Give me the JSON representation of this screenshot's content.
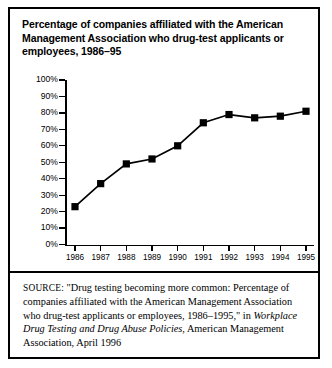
{
  "figure": {
    "title": "Percentage of companies affiliated with the American Management Association who drug-test applicants or employees, 1986–95",
    "source": {
      "label": "SOURCE:",
      "text_part1": " \"Drug testing becoming more common: Percentage of companies affiliated with the American Management Association who drug-test applicants or employees, 1986–1995,\" in ",
      "italic_title": "Workplace Drug Testing and Drug Abuse Policies",
      "text_part2": ", American Management Association, April 1996"
    }
  },
  "chart_data": {
    "type": "line",
    "title": "Percentage of companies affiliated with the American Management Association who drug-test applicants or employees, 1986–95",
    "xlabel": "",
    "ylabel": "",
    "categories": [
      "1986",
      "1987",
      "1988",
      "1989",
      "1990",
      "1991",
      "1992",
      "1993",
      "1994",
      "1995"
    ],
    "values": [
      23,
      37,
      49,
      52,
      60,
      74,
      79,
      77,
      78,
      81
    ],
    "ylim": [
      0,
      100
    ],
    "ytick_labels": [
      "100%",
      "90%",
      "80%",
      "70%",
      "60%",
      "50%",
      "40%",
      "30%",
      "20%",
      "10%",
      "0%"
    ],
    "ytick_values": [
      100,
      90,
      80,
      70,
      60,
      50,
      40,
      30,
      20,
      10,
      0
    ],
    "grid": false,
    "legend": false,
    "marker": "square",
    "series_color": "#000000"
  }
}
